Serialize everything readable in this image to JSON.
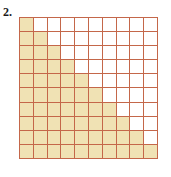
{
  "figure": {
    "problem_number": "2.",
    "caption": "",
    "colors": {
      "shaded_fill": "#f0e2b4",
      "empty_fill": "#ffffff",
      "grid_line": "#c4674a",
      "outer_border": "#b5543a",
      "label_text": "#1a1a1a",
      "background": "#ffffff"
    }
  },
  "chart_data": {
    "type": "heatmap",
    "title": "",
    "subtitle": "",
    "xlabel": "",
    "ylabel": "",
    "rows": 10,
    "columns": 10,
    "total_cells": 100,
    "shaded_cells": 55,
    "unshaded_cells": 45,
    "shaded_per_row": [
      1,
      2,
      3,
      4,
      5,
      6,
      7,
      8,
      9,
      10
    ],
    "legend": [],
    "annotations": [],
    "grid": [
      [
        1,
        0,
        0,
        0,
        0,
        0,
        0,
        0,
        0,
        0
      ],
      [
        1,
        1,
        0,
        0,
        0,
        0,
        0,
        0,
        0,
        0
      ],
      [
        1,
        1,
        1,
        0,
        0,
        0,
        0,
        0,
        0,
        0
      ],
      [
        1,
        1,
        1,
        1,
        0,
        0,
        0,
        0,
        0,
        0
      ],
      [
        1,
        1,
        1,
        1,
        1,
        0,
        0,
        0,
        0,
        0
      ],
      [
        1,
        1,
        1,
        1,
        1,
        1,
        0,
        0,
        0,
        0
      ],
      [
        1,
        1,
        1,
        1,
        1,
        1,
        1,
        0,
        0,
        0
      ],
      [
        1,
        1,
        1,
        1,
        1,
        1,
        1,
        1,
        0,
        0
      ],
      [
        1,
        1,
        1,
        1,
        1,
        1,
        1,
        1,
        1,
        0
      ],
      [
        1,
        1,
        1,
        1,
        1,
        1,
        1,
        1,
        1,
        1
      ]
    ]
  }
}
